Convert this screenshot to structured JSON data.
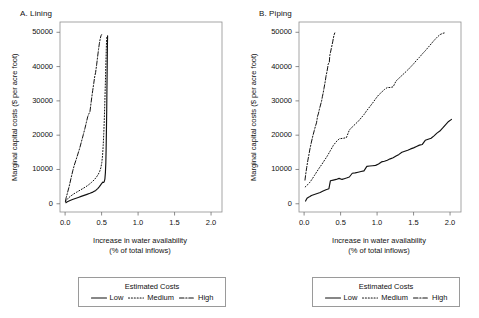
{
  "figure": {
    "width": 479,
    "height": 318,
    "background": "#ffffff",
    "ink": "#111111"
  },
  "legend": {
    "title": "Estimated Costs",
    "entries": [
      {
        "label": "Low",
        "style": "solid",
        "swatch": "solid-line-swatch"
      },
      {
        "label": "Medium",
        "style": "dotted",
        "swatch": "dotted-line-swatch"
      },
      {
        "label": "High",
        "style": "dashdot",
        "swatch": "dashdot-line-swatch"
      }
    ]
  },
  "chart_data": [
    {
      "type": "line",
      "panel": "A",
      "title": "A. Lining",
      "xlabel": "Increase in water availability",
      "xlabel_line2": "(% of total inflows)",
      "ylabel": "Marginal capital costs ($ per acre foot)",
      "xlim": [
        -0.07,
        2.15
      ],
      "ylim": [
        -2400,
        53000
      ],
      "xticks": [
        0.0,
        0.5,
        1.0,
        1.5,
        2.0
      ],
      "xticklabels": [
        "0.0",
        "0.5",
        "1.0",
        "1.5",
        "2.0"
      ],
      "yticks": [
        0,
        10000,
        20000,
        30000,
        40000,
        50000
      ],
      "yticklabels": [
        "0",
        "10000",
        "20000",
        "30000",
        "40000",
        "50000"
      ],
      "grid": false,
      "legend_position": "below-figure",
      "series": [
        {
          "name": "Low",
          "style": "solid",
          "x": [
            0.01,
            0.03,
            0.06,
            0.1,
            0.14,
            0.18,
            0.22,
            0.26,
            0.3,
            0.34,
            0.38,
            0.42,
            0.45,
            0.47,
            0.49,
            0.505,
            0.515,
            0.525,
            0.535,
            0.545,
            0.552,
            0.558,
            0.562,
            0.566,
            0.57,
            0.573,
            0.576,
            0.578,
            0.58,
            0.582
          ],
          "y": [
            300,
            600,
            900,
            1250,
            1550,
            1850,
            2150,
            2450,
            2750,
            3050,
            3400,
            3900,
            4500,
            5000,
            5600,
            6000,
            6300,
            6200,
            6400,
            7200,
            9000,
            12000,
            16000,
            21000,
            27000,
            33000,
            38500,
            43000,
            46500,
            49000
          ]
        },
        {
          "name": "Medium",
          "style": "dotted",
          "x": [
            0.005,
            0.02,
            0.045,
            0.08,
            0.12,
            0.16,
            0.2,
            0.24,
            0.28,
            0.32,
            0.36,
            0.4,
            0.43,
            0.455,
            0.475,
            0.49,
            0.503,
            0.513,
            0.522,
            0.53,
            0.537,
            0.543,
            0.548,
            0.553,
            0.557,
            0.561,
            0.564,
            0.567,
            0.57,
            0.572
          ],
          "y": [
            600,
            1100,
            1700,
            2300,
            2900,
            3400,
            3900,
            4400,
            4900,
            5500,
            6200,
            7000,
            7800,
            8600,
            9500,
            10500,
            12000,
            14000,
            17000,
            20500,
            24500,
            28500,
            32500,
            36000,
            39500,
            42500,
            45000,
            46800,
            48200,
            49000
          ]
        },
        {
          "name": "High",
          "style": "dashdot",
          "x": [
            0.005,
            0.015,
            0.03,
            0.055,
            0.085,
            0.105,
            0.125,
            0.15,
            0.175,
            0.2,
            0.225,
            0.25,
            0.272,
            0.292,
            0.31,
            0.325,
            0.34,
            0.352,
            0.365,
            0.378,
            0.392,
            0.405,
            0.418,
            0.432,
            0.445,
            0.458,
            0.47,
            0.482,
            0.492,
            0.5
          ],
          "y": [
            800,
            1800,
            3000,
            5000,
            7800,
            9600,
            11200,
            12800,
            14500,
            16200,
            18200,
            20200,
            22000,
            23800,
            25400,
            26200,
            26800,
            28800,
            31000,
            33000,
            35000,
            37000,
            38300,
            40500,
            42800,
            45000,
            46800,
            48200,
            49000,
            49300
          ]
        }
      ]
    },
    {
      "type": "line",
      "panel": "B",
      "title": "B. Piping",
      "xlabel": "Increase in water availability",
      "xlabel_line2": "(% of total inflows)",
      "ylabel": "Marginal capital costs ($ per acre foot)",
      "xlim": [
        -0.07,
        2.15
      ],
      "ylim": [
        -2400,
        53000
      ],
      "xticks": [
        0.0,
        0.5,
        1.0,
        1.5,
        2.0
      ],
      "xticklabels": [
        "0.0",
        "0.5",
        "1.0",
        "1.5",
        "2.0"
      ],
      "yticks": [
        0,
        10000,
        20000,
        30000,
        40000,
        50000
      ],
      "yticklabels": [
        "0",
        "10000",
        "20000",
        "30000",
        "40000",
        "50000"
      ],
      "grid": false,
      "legend_position": "below-figure",
      "series": [
        {
          "name": "Low",
          "style": "solid",
          "x": [
            0.02,
            0.04,
            0.06,
            0.08,
            0.1,
            0.14,
            0.18,
            0.22,
            0.26,
            0.3,
            0.34,
            0.36,
            0.4,
            0.44,
            0.48,
            0.52,
            0.55,
            0.58,
            0.62,
            0.66,
            0.7,
            0.74,
            0.78,
            0.82,
            0.86,
            0.9,
            0.94,
            0.98,
            1.02,
            1.06,
            1.1,
            1.14,
            1.18,
            1.22,
            1.26,
            1.3,
            1.34,
            1.38,
            1.42,
            1.46,
            1.5,
            1.54,
            1.58,
            1.62,
            1.66,
            1.7,
            1.74,
            1.78,
            1.82,
            1.86,
            1.9,
            1.94,
            1.98,
            2.02
          ],
          "y": [
            800,
            1600,
            1900,
            2100,
            2400,
            2700,
            3000,
            3300,
            3700,
            4100,
            4400,
            6700,
            6900,
            7100,
            7400,
            7100,
            7300,
            7500,
            7800,
            8900,
            9000,
            9200,
            9400,
            9600,
            10900,
            11000,
            11100,
            11200,
            11600,
            12200,
            12400,
            12700,
            13100,
            13400,
            13900,
            14400,
            15000,
            15300,
            15600,
            16000,
            16300,
            16700,
            17100,
            17300,
            18500,
            18800,
            19100,
            19800,
            20600,
            21200,
            22100,
            23100,
            24000,
            24600
          ]
        },
        {
          "name": "Medium",
          "style": "dotted",
          "x": [
            0.015,
            0.03,
            0.05,
            0.08,
            0.11,
            0.14,
            0.17,
            0.2,
            0.24,
            0.28,
            0.32,
            0.36,
            0.4,
            0.44,
            0.48,
            0.5,
            0.54,
            0.58,
            0.62,
            0.66,
            0.7,
            0.74,
            0.78,
            0.82,
            0.86,
            0.9,
            0.94,
            0.98,
            1.02,
            1.06,
            1.1,
            1.14,
            1.18,
            1.22,
            1.26,
            1.3,
            1.34,
            1.38,
            1.42,
            1.46,
            1.5,
            1.54,
            1.58,
            1.62,
            1.66,
            1.7,
            1.74,
            1.78,
            1.82,
            1.86,
            1.9,
            1.94
          ],
          "y": [
            4900,
            5200,
            5600,
            6300,
            7200,
            8200,
            9200,
            10200,
            11400,
            12700,
            14000,
            15500,
            17000,
            18100,
            18900,
            19000,
            19100,
            19300,
            21500,
            22400,
            23200,
            24000,
            25000,
            26000,
            27200,
            28300,
            29400,
            30600,
            31700,
            32500,
            33300,
            33900,
            33900,
            34100,
            35800,
            36600,
            37400,
            38200,
            39000,
            39900,
            40800,
            41800,
            42700,
            43700,
            44600,
            45600,
            46600,
            47600,
            48500,
            49300,
            49700,
            49900
          ]
        },
        {
          "name": "High",
          "style": "dashdot",
          "x": [
            0.012,
            0.022,
            0.035,
            0.05,
            0.065,
            0.08,
            0.1,
            0.12,
            0.14,
            0.155,
            0.17,
            0.185,
            0.195,
            0.21,
            0.225,
            0.24,
            0.25,
            0.262,
            0.272,
            0.282,
            0.292,
            0.3,
            0.312,
            0.322,
            0.33,
            0.338,
            0.345,
            0.352,
            0.362,
            0.372,
            0.382,
            0.392,
            0.4,
            0.41,
            0.42
          ],
          "y": [
            6900,
            8600,
            10500,
            12500,
            14200,
            16000,
            18000,
            19800,
            21400,
            22600,
            23600,
            25600,
            26200,
            27600,
            28800,
            30000,
            31200,
            32400,
            33600,
            34800,
            36000,
            37200,
            38400,
            39600,
            40700,
            41000,
            41200,
            43200,
            44200,
            45200,
            46200,
            47200,
            48200,
            49200,
            49800
          ]
        }
      ]
    }
  ]
}
